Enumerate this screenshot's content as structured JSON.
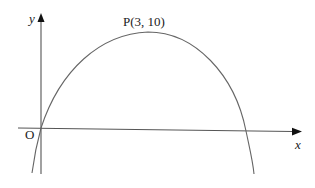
{
  "figure": {
    "axes": {
      "x_label": "x",
      "y_label": "y",
      "origin_label": "O"
    },
    "curve": {
      "type": "parabola (downward opening)",
      "vertex_label": "P(3, 10)",
      "vertex": [
        3,
        10
      ],
      "passes_through_origin": true
    },
    "colors": {
      "axis": "#555555",
      "curve": "#666666",
      "text": "#222222"
    }
  }
}
